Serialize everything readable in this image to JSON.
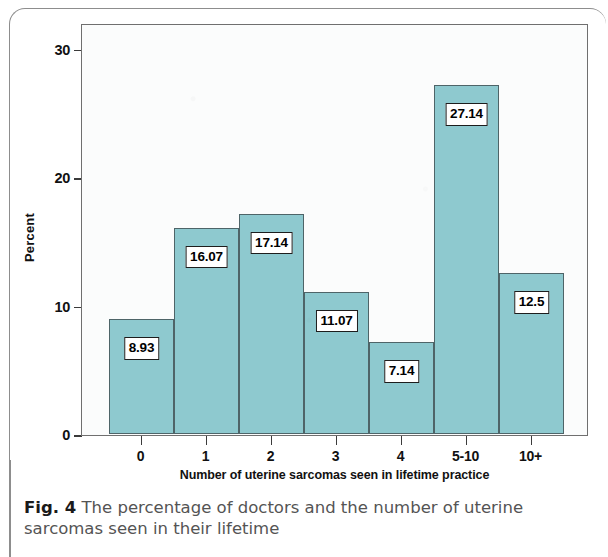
{
  "figure": {
    "caption_prefix": "Fig. 4",
    "caption_text": "The percentage of doctors and the number of uterine sarcomas seen in their lifetime"
  },
  "chart_data": {
    "type": "bar",
    "title": "",
    "subtitle": "",
    "xlabel": "Number of uterine sarcomas seen in lifetime practice",
    "ylabel": "Percent",
    "categories": [
      "0",
      "1",
      "2",
      "3",
      "4",
      "5-10",
      "10+"
    ],
    "values": [
      8.93,
      16.07,
      17.14,
      11.07,
      7.14,
      27.14,
      12.5
    ],
    "data_labels": [
      "8.93",
      "16.07",
      "17.14",
      "11.07",
      "7.14",
      "27.14",
      "12.5"
    ],
    "ylim": [
      0,
      32
    ],
    "y_ticks": [
      0,
      10,
      20,
      30
    ],
    "y_tick_labels": [
      "0",
      "10",
      "20",
      "30"
    ],
    "grid": false,
    "legend": false,
    "legend_position": "none",
    "bar_fill_color": "#8ec9cf",
    "bar_edge_color": "#4e6468",
    "plot_background_color": "#fbfcfc",
    "label_box_background": "#ffffff",
    "label_box_border": "#1d1d1d"
  }
}
